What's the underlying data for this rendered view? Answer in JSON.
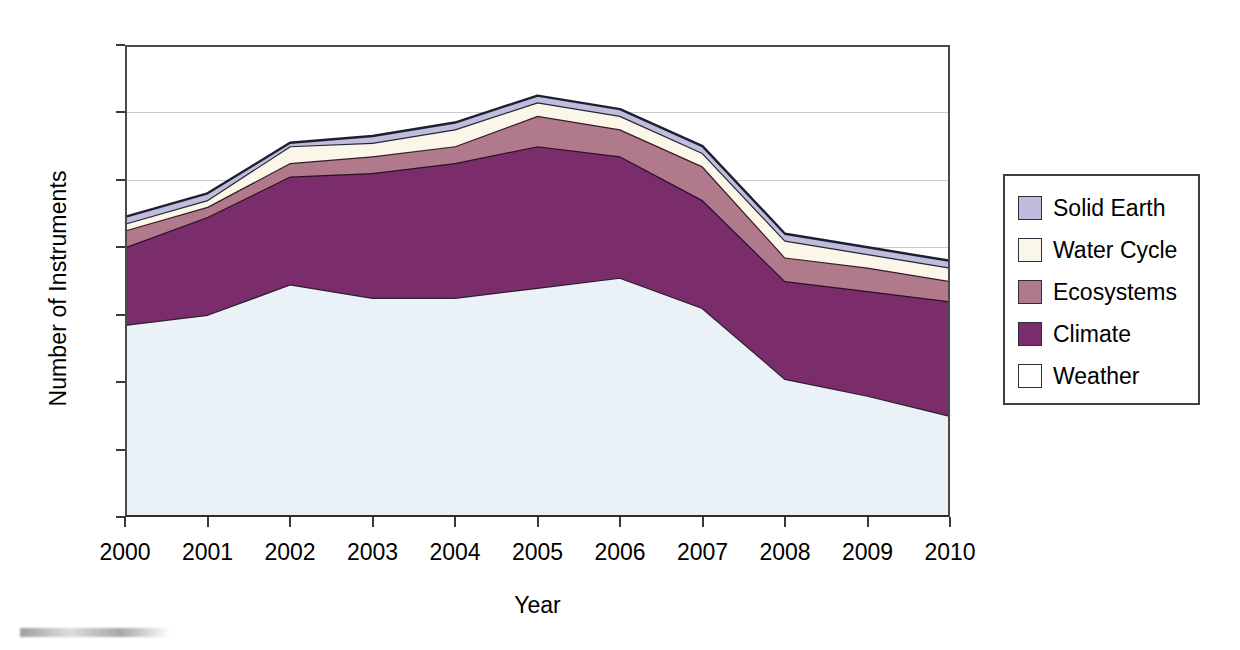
{
  "chart_data": {
    "type": "area",
    "title": "",
    "xlabel": "Year",
    "ylabel": "Number of Instruments",
    "stacked": true,
    "grid": true,
    "legend_position": "right",
    "xlim": [
      2000,
      2010
    ],
    "ylim": [
      0,
      140
    ],
    "ytick_step": 20,
    "yticks": [
      "0",
      "20",
      "40",
      "60",
      "80",
      "100",
      "120",
      "140"
    ],
    "categories": [
      "2000",
      "2001",
      "2002",
      "2003",
      "2004",
      "2005",
      "2006",
      "2007",
      "2008",
      "2009",
      "2010"
    ],
    "series": [
      {
        "name": "Weather",
        "color": "#eaf2f8",
        "edge": "#2b2030",
        "values": [
          57,
          60,
          69,
          65,
          65,
          68,
          71,
          62,
          41,
          36,
          30
        ]
      },
      {
        "name": "Climate",
        "color": "#7b2d6b",
        "edge": "#2b1028",
        "values": [
          23,
          29,
          32,
          37,
          40,
          42,
          36,
          32,
          29,
          31,
          34
        ]
      },
      {
        "name": "Ecosystems",
        "color": "#b0798c",
        "edge": "#3a1a28",
        "values": [
          5,
          3,
          4,
          5,
          5,
          9,
          8,
          10,
          7,
          7,
          6
        ]
      },
      {
        "name": "Water Cycle",
        "color": "#fbf7e8",
        "edge": "#262636",
        "values": [
          2,
          2,
          5,
          4,
          5,
          4,
          4,
          4,
          5,
          4,
          4
        ]
      },
      {
        "name": "Solid Earth",
        "color": "#bfbcdc",
        "edge": "#1f1f33",
        "values": [
          2,
          2,
          1,
          2,
          2,
          2,
          2,
          2,
          2,
          2,
          2
        ]
      }
    ],
    "cumulative_totals": [
      89,
      96,
      111,
      113,
      117,
      125,
      121,
      110,
      84,
      80,
      76
    ]
  },
  "legend": {
    "items": [
      {
        "label": "Solid Earth",
        "color": "#bfbcdc"
      },
      {
        "label": "Water Cycle",
        "color": "#fbf7e8"
      },
      {
        "label": "Ecosystems",
        "color": "#b0798c"
      },
      {
        "label": "Climate",
        "color": "#7b2d6b"
      },
      {
        "label": "Weather",
        "color": "#ffffff"
      }
    ]
  }
}
